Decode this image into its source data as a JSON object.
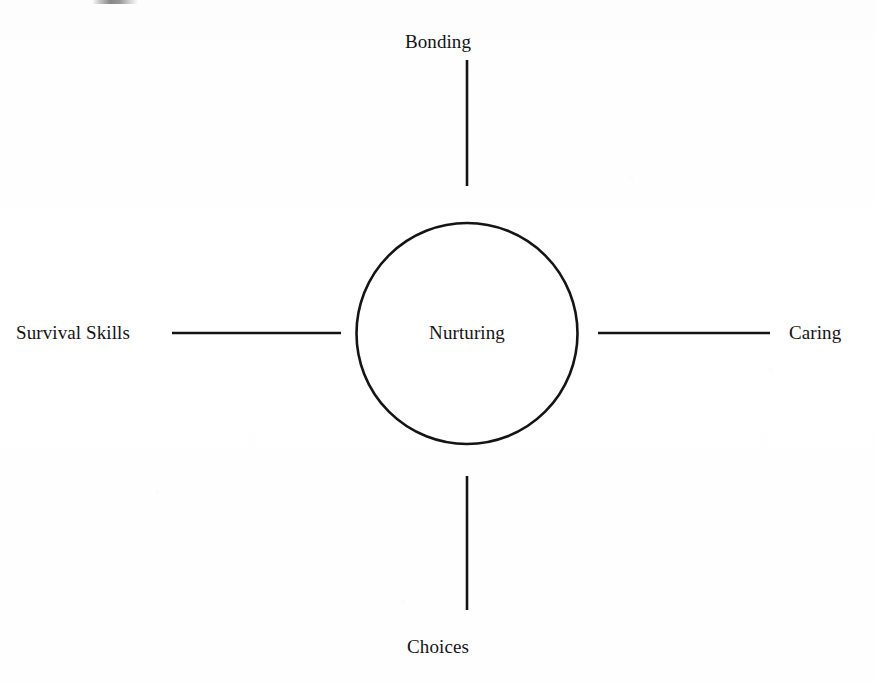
{
  "diagram": {
    "type": "radial-spoke",
    "center": {
      "label": "Nurturing",
      "shape": "circle"
    },
    "spokes": [
      {
        "position": "top",
        "label": "Bonding"
      },
      {
        "position": "right",
        "label": "Caring"
      },
      {
        "position": "bottom",
        "label": "Choices"
      },
      {
        "position": "left",
        "label": "Survival Skills"
      }
    ],
    "colors": {
      "stroke": "#141414",
      "text": "#141414",
      "background": "#fefefe"
    }
  }
}
